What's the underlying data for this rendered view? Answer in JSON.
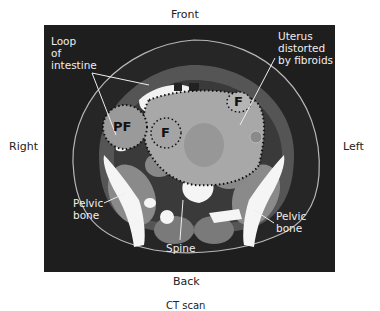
{
  "orientation": {
    "top": "Front",
    "bottom": "Back",
    "left": "Right",
    "right": "Left"
  },
  "caption": "CT scan",
  "annotations": {
    "intestine": [
      "Loop",
      "of",
      "intestine"
    ],
    "uterus": [
      "Uterus",
      "distorted",
      "by fibroids"
    ],
    "pelvic_right": [
      "Pelvic",
      "bone"
    ],
    "pelvic_left": [
      "Pelvic",
      "bone"
    ],
    "spine": "Spine"
  },
  "markers": {
    "pf": "PF",
    "f1": "F",
    "f2": "F"
  },
  "colors": {
    "background": "#1e1e1e",
    "tissue": "#8a8a8a",
    "bone": "#f5f5f5",
    "uterus": "#a8a8a8",
    "label": "#eeeeee"
  }
}
